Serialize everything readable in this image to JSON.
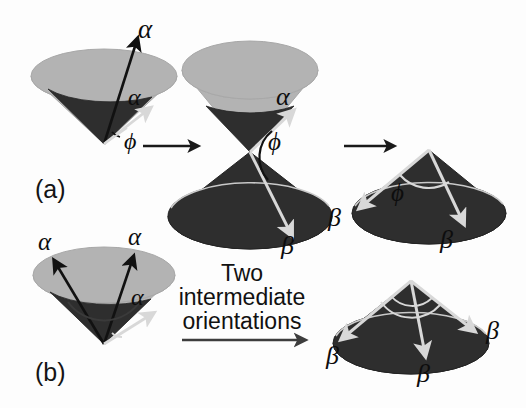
{
  "figure": {
    "background_color": "#fdfdfd",
    "width": 526,
    "height": 408
  },
  "colors": {
    "cone_light": "#b3b3b3",
    "cone_light_edge": "#a8a8a8",
    "cone_dark": "#2e2e2e",
    "cone_dark_edge": "#242424",
    "vector_black": "#111111",
    "vector_white": "#d8d8d8",
    "arrow_connector": "#1a1a1a",
    "arrow_connector_gray": "#5a5a5a",
    "text": "#111111"
  },
  "panels": {
    "a": {
      "label": "(a)",
      "description": "Single alpha cone transitioning to double cone then to beta cone"
    },
    "b": {
      "label": "(b)",
      "description": "Multi alpha cone transitioning to three-vector beta cone"
    }
  },
  "symbols": {
    "alpha": "α",
    "beta": "β",
    "phi": "ϕ"
  },
  "labels": {
    "cone_a1": {
      "alpha_top": "α",
      "alpha_inner": "α",
      "phi": "ϕ"
    },
    "cone_a2": {
      "alpha": "α",
      "phi": "ϕ",
      "beta": "β"
    },
    "cone_a3": {
      "phi": "ϕ",
      "beta_left": "β",
      "beta_right": "β"
    },
    "cone_b1": {
      "alpha_left": "α",
      "alpha_top": "α",
      "alpha_inner": "α"
    },
    "cone_b2": {
      "beta_left": "β",
      "beta_center": "β",
      "beta_right": "β"
    }
  },
  "caption": {
    "line1": "Two",
    "line2": "intermediate",
    "line3": "orientations"
  }
}
